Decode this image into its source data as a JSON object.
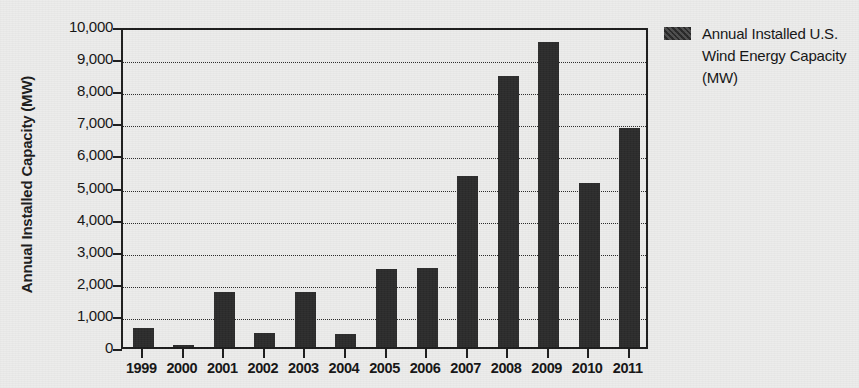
{
  "chart_data": {
    "type": "bar",
    "title": "",
    "xlabel": "",
    "ylabel": "Annual Installed Capacity (MW)",
    "categories": [
      "1999",
      "2000",
      "2001",
      "2002",
      "2003",
      "2004",
      "2005",
      "2006",
      "2007",
      "2008",
      "2009",
      "2010",
      "2011"
    ],
    "values": [
      600,
      60,
      1700,
      450,
      1700,
      390,
      2430,
      2450,
      5330,
      8450,
      9500,
      5120,
      6820
    ],
    "series": [
      {
        "name": "Annual Installed U.S. Wind Energy Capacity (MW)",
        "values": [
          600,
          60,
          1700,
          450,
          1700,
          390,
          2430,
          2450,
          5330,
          8450,
          9500,
          5120,
          6820
        ]
      }
    ],
    "ylim": [
      0,
      10000
    ],
    "ytick_values": [
      0,
      1000,
      2000,
      3000,
      4000,
      5000,
      6000,
      7000,
      8000,
      9000,
      10000
    ],
    "ytick_labels": [
      "0",
      "1,000",
      "2,000",
      "3,000",
      "4,000",
      "5,000",
      "6,000",
      "7,000",
      "8,000",
      "9,000",
      "10,000"
    ],
    "grid": true,
    "grid_axis": "y",
    "legend_position": "right",
    "bar_color": "#2b2b2b",
    "background_color": "#ececeb",
    "axis_color": "#1c1c1c"
  },
  "axes": {
    "y_title": "Annual Installed Capacity (MW)"
  },
  "legend": {
    "entries": [
      {
        "label": "Annual Installed U.S. Wind Energy Capacity (MW)",
        "color": "#2b2b2b"
      }
    ]
  }
}
